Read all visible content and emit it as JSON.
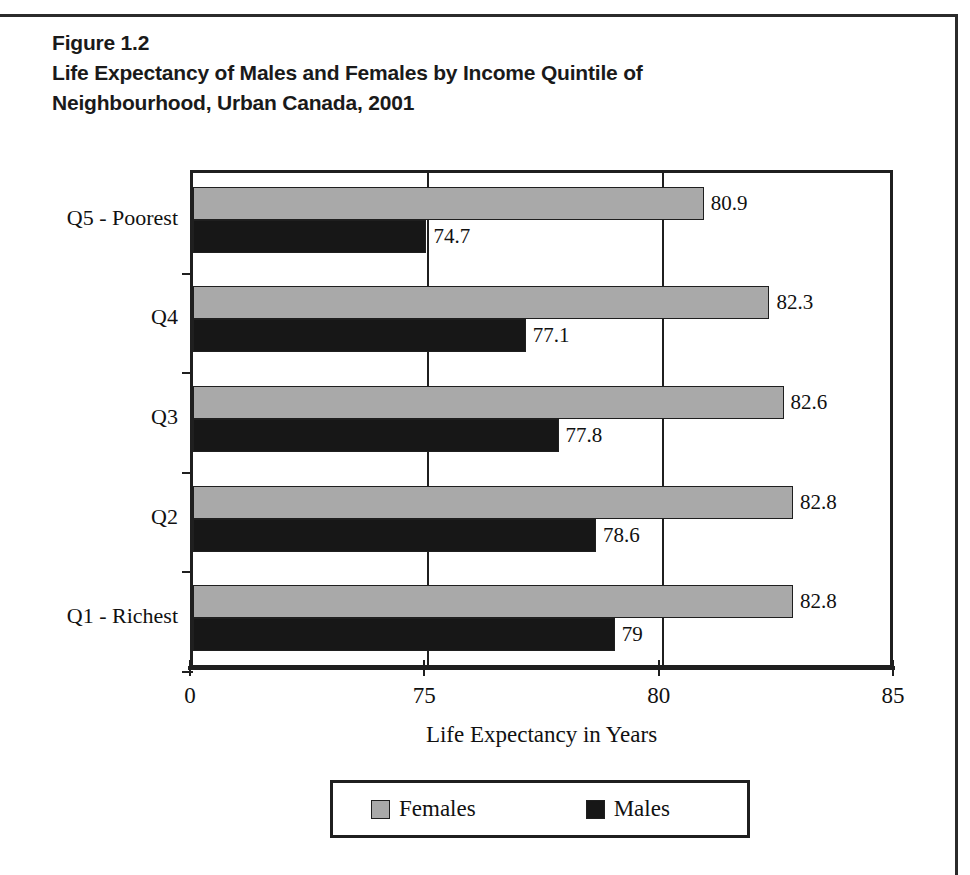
{
  "figure": {
    "number": "Figure 1.2",
    "title_line1": "Life Expectancy of Males and Females by Income Quintile of",
    "title_line2": "Neighbourhood, Urban Canada, 2001"
  },
  "colors": {
    "female": "#a9a9a9",
    "male": "#171717",
    "axis": "#1f1f1f",
    "background": "#ffffff"
  },
  "legend": {
    "position": "bottom",
    "entries": [
      {
        "label": "Females",
        "color": "#a9a9a9"
      },
      {
        "label": "Males",
        "color": "#171717"
      }
    ]
  },
  "axis": {
    "x_title": "Life Expectancy in Years",
    "x_ticks": [
      "0",
      "75",
      "80",
      "85"
    ]
  },
  "chart_data": {
    "type": "bar",
    "orientation": "horizontal",
    "title": "Life Expectancy of Males and Females by Income Quintile of Neighbourhood, Urban Canada, 2001",
    "xlabel": "Life Expectancy in Years",
    "ylabel": "",
    "xlim": [
      0,
      85
    ],
    "x_ticks": [
      0,
      75,
      80,
      85
    ],
    "x_axis_note": "broken axis: 0 to 75 occupies the same width as 75 to 80 and 80 to 85",
    "grid": true,
    "legend_position": "bottom",
    "categories": [
      "Q5 - Poorest",
      "Q4",
      "Q3",
      "Q2",
      "Q1 - Richest"
    ],
    "series": [
      {
        "name": "Females",
        "color": "#a9a9a9",
        "values": [
          80.9,
          82.3,
          82.6,
          82.8,
          82.8
        ],
        "labels": [
          "80.9",
          "82.3",
          "82.6",
          "82.8",
          "82.8"
        ]
      },
      {
        "name": "Males",
        "color": "#171717",
        "values": [
          74.7,
          77.1,
          77.8,
          78.6,
          79.0
        ],
        "labels": [
          "74.7",
          "77.1",
          "77.8",
          "78.6",
          "79"
        ]
      }
    ]
  }
}
